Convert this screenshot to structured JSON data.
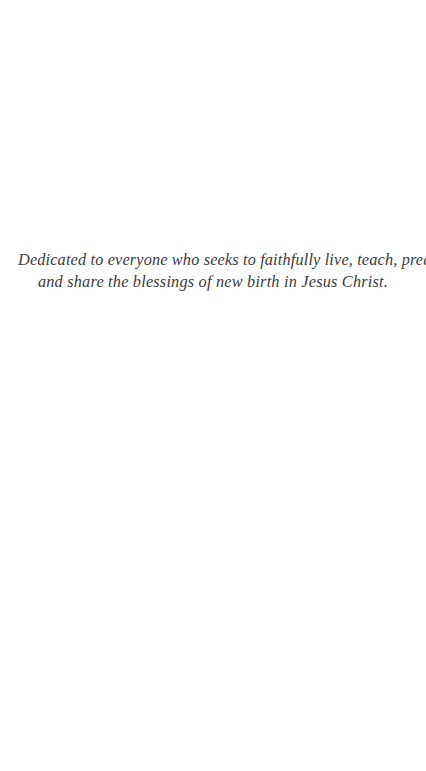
{
  "page": {
    "background_color": "#ffffff",
    "text_color": "#3b3b40",
    "type": "book-dedication-page"
  },
  "dedication": {
    "lines": [
      "Dedicated to everyone who seeks to faithfully live, teach, preach,",
      "and share the blessings of new birth in Jesus Christ."
    ],
    "full_text": "Dedicated to everyone who seeks to faithfully live, teach, preach, and share the blessings of new birth in Jesus Christ.",
    "alignment": "center",
    "style": "italic"
  }
}
